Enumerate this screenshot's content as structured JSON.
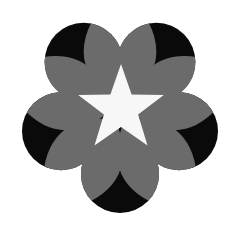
{
  "figure": {
    "colors": {
      "background": "#ffffff",
      "lobe": "#0a0a0a",
      "petal": "#6b6b6b",
      "star": "#f7f7f7"
    },
    "center": [
      120,
      112
    ],
    "lobes": {
      "count": 5,
      "ring_radius": 62,
      "circle_radius": 39,
      "angles_deg": [
        -126,
        -54,
        18,
        90,
        162
      ]
    },
    "petals": {
      "count": 10,
      "inner_radius": 10,
      "outer_radius": 104,
      "half_width": 24,
      "angles_deg": [
        -150,
        -102,
        -78,
        -30,
        -6,
        42,
        66,
        114,
        138,
        186
      ]
    },
    "star": {
      "center": [
        121,
        109
      ],
      "outer_radius": 45,
      "inner_radius": 18,
      "points": 5
    }
  }
}
